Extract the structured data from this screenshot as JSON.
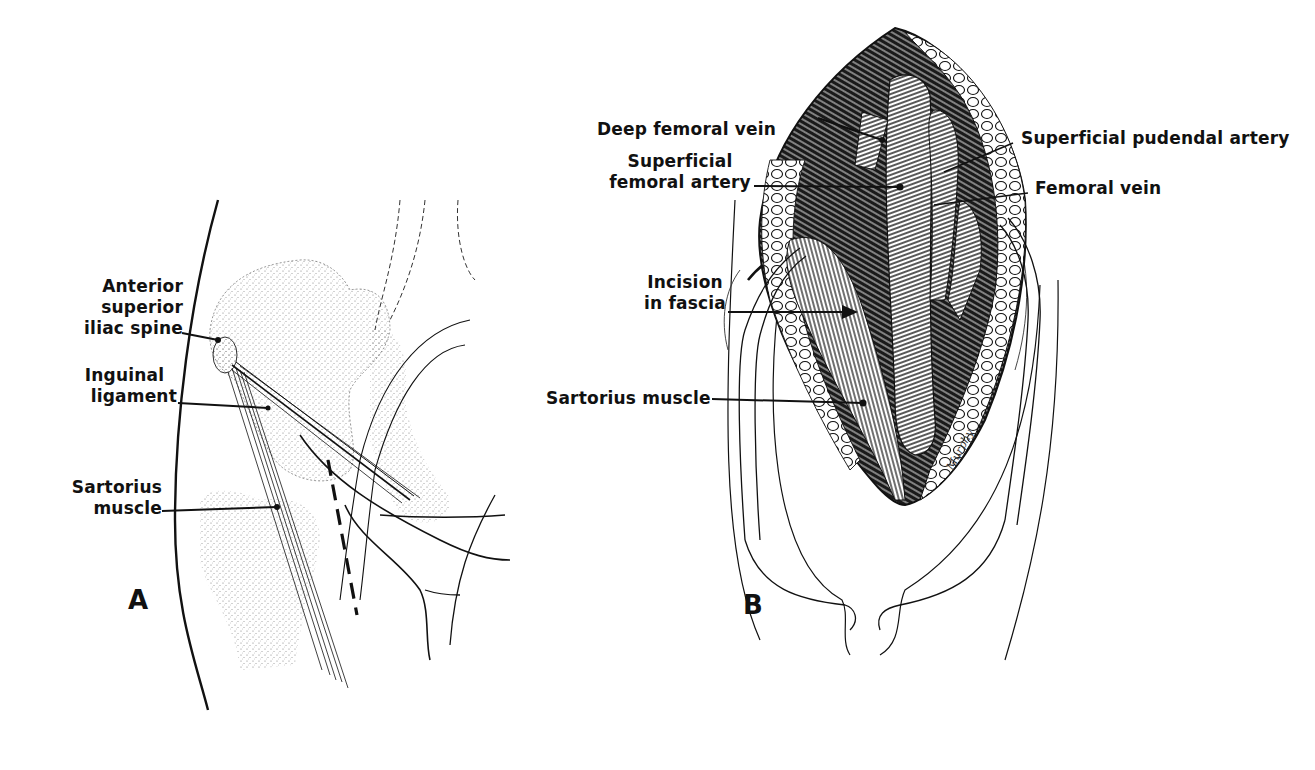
{
  "figure": {
    "panels": [
      {
        "id": "A",
        "letter": "A",
        "labels": {
          "asis": "Anterior\nsuperior\niliac spine",
          "asis_lines": [
            "Anterior",
            "superior",
            "iliac spine"
          ],
          "inguinal_lines": [
            "Inguinal",
            "ligament"
          ],
          "sartorius_lines": [
            "Sartorius",
            "muscle"
          ]
        }
      },
      {
        "id": "B",
        "letter": "B",
        "labels": {
          "deep_femoral_vein": "Deep femoral vein",
          "superficial_femoral_artery_lines": [
            "Superficial",
            "femoral artery"
          ],
          "superficial_pudendal_artery": "Superficial pudendal artery",
          "femoral_vein": "Femoral vein",
          "incision_lines": [
            "Incision",
            "in fascia"
          ],
          "sartorius_muscle": "Sartorius muscle"
        },
        "signature": "Murphy"
      }
    ],
    "colors": {
      "ink": "#111111",
      "background": "#ffffff",
      "stipple": "#8a8a8a"
    }
  }
}
